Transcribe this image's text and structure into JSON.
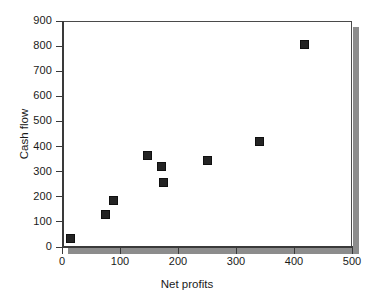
{
  "chart_data": {
    "type": "scatter",
    "title": "",
    "xlabel": "Net profits",
    "ylabel": "Cash flow",
    "xlim": [
      0,
      500
    ],
    "ylim": [
      0,
      900
    ],
    "xticks": [
      0,
      100,
      200,
      300,
      400,
      500
    ],
    "yticks": [
      0,
      100,
      200,
      300,
      400,
      500,
      600,
      700,
      800,
      900
    ],
    "xtick_labels": [
      "0",
      "100",
      "200",
      "300",
      "400",
      "500"
    ],
    "ytick_labels": [
      "0",
      "100",
      "200",
      "300",
      "400",
      "500",
      "600",
      "700",
      "800",
      "900"
    ],
    "grid": false,
    "legend": null,
    "marker_style": "filled-square",
    "marker_color": "#242424",
    "points": [
      {
        "x": 15,
        "y": 35
      },
      {
        "x": 75,
        "y": 130
      },
      {
        "x": 88,
        "y": 185
      },
      {
        "x": 148,
        "y": 365
      },
      {
        "x": 172,
        "y": 320
      },
      {
        "x": 175,
        "y": 258
      },
      {
        "x": 250,
        "y": 345
      },
      {
        "x": 340,
        "y": 420
      },
      {
        "x": 418,
        "y": 805
      }
    ],
    "series": [
      {
        "name": "Cash flow vs Net profits",
        "x": [
          15,
          75,
          88,
          148,
          172,
          175,
          250,
          340,
          418
        ],
        "values": [
          35,
          130,
          185,
          365,
          320,
          258,
          345,
          420,
          805
        ]
      }
    ]
  },
  "axis_titles": {
    "x": "Net profits",
    "y": "Cash flow"
  }
}
